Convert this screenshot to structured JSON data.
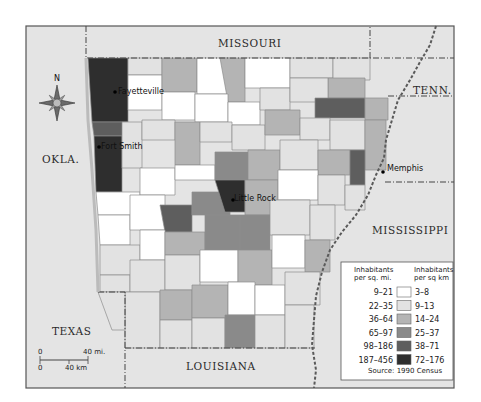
{
  "map": {
    "title": "Arkansas population density by county",
    "neighbors": {
      "missouri": "MISSOURI",
      "tennessee": "TENN.",
      "oklahoma": "OKLA.",
      "mississippi": "MISSISSIPPI",
      "texas": "TEXAS",
      "louisiana": "LOUISIANA"
    },
    "cities": [
      {
        "name": "Fayetteville"
      },
      {
        "name": "Fort Smith"
      },
      {
        "name": "Little Rock"
      },
      {
        "name": "Memphis"
      }
    ],
    "compass": {
      "label": "N"
    },
    "scale": {
      "miles_start": "0",
      "miles_end": "40 mi.",
      "km_start": "0",
      "km_end": "40 km"
    }
  },
  "legend": {
    "header_left": [
      "Inhabitants",
      "per sq. mi."
    ],
    "header_right": [
      "Inhabitants",
      "per sq km"
    ],
    "classes": [
      {
        "mi": "9–21",
        "km": "3–8",
        "color": "#ffffff"
      },
      {
        "mi": "22–35",
        "km": "9–13",
        "color": "#e2e2e2"
      },
      {
        "mi": "36–64",
        "km": "14–24",
        "color": "#b4b4b4"
      },
      {
        "mi": "65–97",
        "km": "25–37",
        "color": "#8a8a8a"
      },
      {
        "mi": "98–186",
        "km": "38–71",
        "color": "#5e5e5e"
      },
      {
        "mi": "187–456",
        "km": "72–176",
        "color": "#2e2e2e"
      }
    ],
    "source": "Source: 1990 Census"
  },
  "colors": {
    "background": "#ffffff",
    "frame": "#555555",
    "neighbor_fill": "#e4e4e4",
    "county_border": "#8c8c8c",
    "river": "#5a5a5a"
  }
}
